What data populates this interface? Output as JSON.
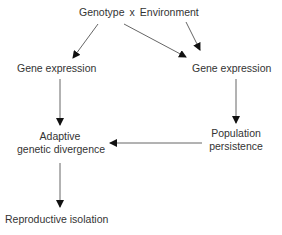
{
  "diagram": {
    "title_row": {
      "genotype": "Genotype",
      "operator": "x",
      "environment": "Environment"
    },
    "nodes": {
      "gene_expression_left": "Gene expression",
      "gene_expression_right": "Gene expression",
      "adaptive_line1": "Adaptive",
      "adaptive_line2": "genetic divergence",
      "population_line1": "Population",
      "population_line2": "persistence",
      "reproductive_isolation": "Reproductive isolation"
    },
    "edges": [
      {
        "from": "Genotype",
        "to": "Gene expression (left)"
      },
      {
        "from": "Genotype",
        "to": "Gene expression (right)"
      },
      {
        "from": "Environment",
        "to": "Gene expression (right)"
      },
      {
        "from": "Gene expression (left)",
        "to": "Adaptive genetic divergence"
      },
      {
        "from": "Gene expression (right)",
        "to": "Population persistence"
      },
      {
        "from": "Population persistence",
        "to": "Adaptive genetic divergence"
      },
      {
        "from": "Adaptive genetic divergence",
        "to": "Reproductive isolation"
      }
    ],
    "colors": {
      "text": "#333333",
      "line": "#555555",
      "arrowhead": "#111111"
    }
  }
}
